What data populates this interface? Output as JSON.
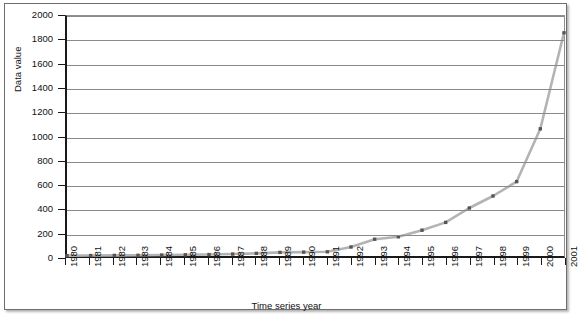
{
  "chart_data": {
    "type": "line",
    "title": "",
    "xlabel": "Time series year",
    "ylabel": "Data value",
    "grid": true,
    "legend": "none",
    "xlim": [
      1980,
      2001
    ],
    "ylim": [
      0,
      2000
    ],
    "ytick_step": 200,
    "yticks": [
      0,
      200,
      400,
      600,
      800,
      1000,
      1200,
      1400,
      1600,
      1800,
      2000
    ],
    "ytick_labels": [
      "0",
      "200",
      "400",
      "600",
      "800",
      "1000",
      "1200",
      "1400",
      "1600",
      "1800",
      "2000"
    ],
    "categories": [
      1980,
      1981,
      1982,
      1983,
      1984,
      1985,
      1986,
      1987,
      1988,
      1989,
      1990,
      1991,
      1992,
      1993,
      1994,
      1995,
      1996,
      1997,
      1998,
      1999,
      2000,
      2001
    ],
    "xtick_labels": [
      "1980",
      "1981",
      "1982",
      "1983",
      "1984",
      "1985",
      "1986",
      "1987",
      "1988",
      "1989",
      "1990",
      "1991",
      "1992",
      "1993",
      "1994",
      "1995",
      "1996",
      "1997",
      "1998",
      "1999",
      "2000",
      "2001"
    ],
    "series": [
      {
        "name": "Data value",
        "line_color": "#b3b3b3",
        "marker_color": "#555555",
        "values": [
          3,
          4,
          5,
          6,
          8,
          10,
          12,
          16,
          22,
          30,
          32,
          35,
          75,
          140,
          160,
          215,
          280,
          400,
          500,
          620,
          1060,
          1860
        ]
      }
    ]
  },
  "colors": {
    "axis": "#1a1a1a",
    "gridline": "#8a8a8a",
    "line": "#b3b3b3",
    "marker": "#555555",
    "frame": "#6e6e6e",
    "background": "#ffffff"
  }
}
